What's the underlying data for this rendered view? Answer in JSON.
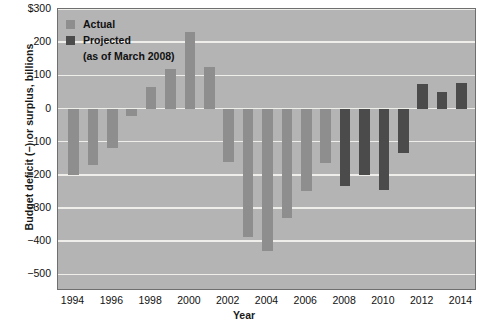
{
  "chart_data": {
    "type": "bar",
    "title": "",
    "xlabel": "Year",
    "ylabel": "Budget deficit (−) or surplus, billions",
    "ylim": [
      -550,
      300
    ],
    "xlim": [
      1993.2,
      2014.8
    ],
    "grid": true,
    "yticks": [
      300,
      200,
      100,
      0,
      -100,
      -200,
      -300,
      -400,
      -500
    ],
    "ytick_labels": [
      "$300",
      "200",
      "100",
      "0",
      "−100",
      "−200",
      "−300",
      "−400",
      "−500"
    ],
    "xticks": [
      1994,
      1996,
      1998,
      2000,
      2002,
      2004,
      2006,
      2008,
      2010,
      2012,
      2014
    ],
    "xtick_labels": [
      "1994",
      "1996",
      "1998",
      "2000",
      "2002",
      "2004",
      "2006",
      "2008",
      "2010",
      "2012",
      "2014"
    ],
    "legend_position": "top-left",
    "legend": [
      {
        "label": "Actual",
        "color": "#8e8e8e",
        "key": "actual"
      },
      {
        "label": "Projected",
        "color": "#4b4b4b",
        "key": "projected"
      },
      {
        "label": "(as of March 2008)",
        "color": "",
        "key": "note"
      }
    ],
    "colors": {
      "actual": "#8e8e8e",
      "projected": "#4b4b4b",
      "plot_background": "#b4b4b4",
      "gridline": "#efeeea",
      "frame": "#6f6f6f"
    },
    "categories": [
      1994,
      1995,
      1996,
      1997,
      1998,
      1999,
      2000,
      2001,
      2002,
      2003,
      2004,
      2005,
      2006,
      2007,
      2008,
      2009,
      2010,
      2011,
      2012,
      2013,
      2014
    ],
    "values": [
      -200,
      -170,
      -118,
      -22,
      66,
      120,
      230,
      126,
      -160,
      -388,
      -428,
      -329,
      -250,
      -165,
      -235,
      -200,
      -247,
      -135,
      75,
      50,
      78
    ],
    "series_key": [
      "actual",
      "actual",
      "actual",
      "actual",
      "actual",
      "actual",
      "actual",
      "actual",
      "actual",
      "actual",
      "actual",
      "actual",
      "actual",
      "actual",
      "projected",
      "projected",
      "projected",
      "projected",
      "projected",
      "projected",
      "projected"
    ],
    "series": [
      {
        "name": "Actual",
        "key": "actual",
        "points": [
          {
            "x": 1994,
            "y": -200
          },
          {
            "x": 1995,
            "y": -170
          },
          {
            "x": 1996,
            "y": -118
          },
          {
            "x": 1997,
            "y": -22
          },
          {
            "x": 1998,
            "y": 66
          },
          {
            "x": 1999,
            "y": 120
          },
          {
            "x": 2000,
            "y": 230
          },
          {
            "x": 2001,
            "y": 126
          },
          {
            "x": 2002,
            "y": -160
          },
          {
            "x": 2003,
            "y": -388
          },
          {
            "x": 2004,
            "y": -428
          },
          {
            "x": 2005,
            "y": -329
          },
          {
            "x": 2006,
            "y": -250
          },
          {
            "x": 2007,
            "y": -165
          }
        ]
      },
      {
        "name": "Projected (as of March 2008)",
        "key": "projected",
        "points": [
          {
            "x": 2008,
            "y": -235
          },
          {
            "x": 2009,
            "y": -200
          },
          {
            "x": 2010,
            "y": -247
          },
          {
            "x": 2011,
            "y": -135
          },
          {
            "x": 2012,
            "y": 75
          },
          {
            "x": 2013,
            "y": 50
          },
          {
            "x": 2014,
            "y": 78
          }
        ]
      }
    ]
  }
}
